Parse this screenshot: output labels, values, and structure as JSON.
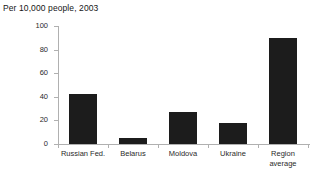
{
  "chart_data": {
    "type": "bar",
    "title": "Per 10,000 people, 2003",
    "xlabel": "",
    "ylabel": "",
    "ylim": [
      0,
      100
    ],
    "yticks": [
      0,
      20,
      40,
      60,
      80,
      100
    ],
    "grid": false,
    "legend": false,
    "bar_color": "#1c1c1c",
    "axis_color": "#b0b0b0",
    "background": "#ffffff",
    "categories": [
      "Russian Fed.",
      "Belarus",
      "Moldova",
      "Ukraine",
      "Region\naverage"
    ],
    "values": [
      42,
      5,
      27,
      18,
      90
    ]
  }
}
